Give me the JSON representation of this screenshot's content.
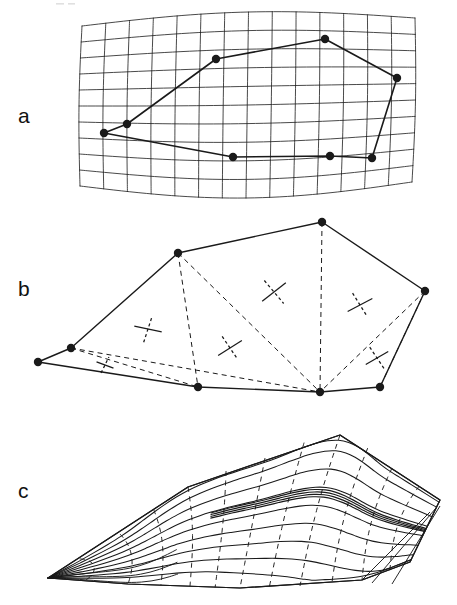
{
  "figure": {
    "type": "multi-panel-scientific-figure",
    "panel_count": 3,
    "background_color": "#ffffff",
    "line_color": "#1a1a1a",
    "width": 457,
    "height": 605
  },
  "panels": [
    {
      "id": "a",
      "label": "a",
      "label_pos": [
        18,
        123
      ],
      "name": "deformed-grid-panel",
      "description": "curvilinear quadrilateral grid with overlaid station polygon",
      "grid": {
        "columns": 14,
        "rows": 10,
        "corners": [
          [
            82,
            26
          ],
          [
            415,
            18
          ],
          [
            412,
            182
          ],
          [
            80,
            186
          ]
        ],
        "curvature_top": 10,
        "curvature_bottom": 14,
        "line_width": 0.8
      },
      "station_polygon": {
        "closed": true,
        "line_width": 1.6,
        "marker_radius": 4.2,
        "vertices": [
          [
            104,
            133
          ],
          [
            127,
            124
          ],
          [
            216,
            59
          ],
          [
            325,
            39
          ],
          [
            397,
            78
          ],
          [
            372,
            158
          ],
          [
            330,
            156
          ],
          [
            233,
            157
          ]
        ]
      }
    },
    {
      "id": "b",
      "label": "b",
      "label_pos": [
        18,
        296
      ],
      "name": "strain-triangulation-panel",
      "description": "polygon network triangulated with dashed lines, principal strain cross symbols per triangle",
      "polygon": {
        "closed": true,
        "line_width": 1.4,
        "marker_radius": 4.2,
        "vertices": [
          [
            38,
            362
          ],
          [
            71,
            348
          ],
          [
            178,
            253
          ],
          [
            322,
            222
          ],
          [
            425,
            291
          ],
          [
            380,
            387
          ],
          [
            320,
            392
          ],
          [
            198,
            387
          ]
        ]
      },
      "dashed_edges": [
        [
          [
            71,
            348
          ],
          [
            198,
            387
          ]
        ],
        [
          [
            71,
            348
          ],
          [
            320,
            392
          ]
        ],
        [
          [
            178,
            253
          ],
          [
            198,
            387
          ]
        ],
        [
          [
            178,
            253
          ],
          [
            320,
            392
          ]
        ],
        [
          [
            322,
            222
          ],
          [
            320,
            392
          ]
        ],
        [
          [
            425,
            291
          ],
          [
            320,
            392
          ]
        ],
        [
          [
            425,
            291
          ],
          [
            380,
            387
          ]
        ]
      ],
      "strain_crosses": [
        {
          "center": [
            105,
            365
          ],
          "size": 9,
          "solid_angle": 20,
          "dashed_angle": -64
        },
        {
          "center": [
            148,
            329
          ],
          "size": 14,
          "solid_angle": 12,
          "dashed_angle": -72
        },
        {
          "center": [
            230,
            348
          ],
          "size": 14,
          "solid_angle": -32,
          "dashed_angle": 56
        },
        {
          "center": [
            274,
            292
          ],
          "size": 15,
          "solid_angle": -38,
          "dashed_angle": 50
        },
        {
          "center": [
            360,
            305
          ],
          "size": 14,
          "solid_angle": -28,
          "dashed_angle": 58
        },
        {
          "center": [
            377,
            358
          ],
          "size": 13,
          "solid_angle": -30,
          "dashed_angle": 56
        }
      ]
    },
    {
      "id": "c",
      "label": "c",
      "label_pos": [
        18,
        498
      ],
      "name": "contoured-surface-panel",
      "description": "same network rendered as contoured strain surface with dashed trajectory lines",
      "outline": {
        "line_width": 1.2,
        "vertices": [
          [
            48,
            578
          ],
          [
            188,
            487
          ],
          [
            340,
            435
          ],
          [
            440,
            500
          ],
          [
            410,
            562
          ],
          [
            362,
            580
          ],
          [
            240,
            588
          ],
          [
            128,
            584
          ]
        ]
      },
      "contour_count": 9,
      "dashed_trajectory_count": 11,
      "dense_band": {
        "description": "tight bundle of contours indicating steep strain gradient near right edge",
        "line_count": 4
      }
    }
  ],
  "legend_text": {
    "panel_a_caption": "",
    "panel_b_caption": "",
    "panel_c_caption": ""
  }
}
